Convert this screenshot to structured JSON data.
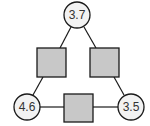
{
  "diagram": {
    "type": "triangle-arithmagon",
    "circles": [
      {
        "id": "top",
        "value": "3.7"
      },
      {
        "id": "bottom-left",
        "value": "4.6"
      },
      {
        "id": "bottom-right",
        "value": "3.5"
      }
    ],
    "squares": [
      {
        "id": "left",
        "value": ""
      },
      {
        "id": "right",
        "value": ""
      },
      {
        "id": "bottom",
        "value": ""
      }
    ],
    "colors": {
      "circle_fill": "#f2f2f2",
      "square_fill": "#c8c8c8",
      "stroke": "#1a1a1a"
    }
  }
}
